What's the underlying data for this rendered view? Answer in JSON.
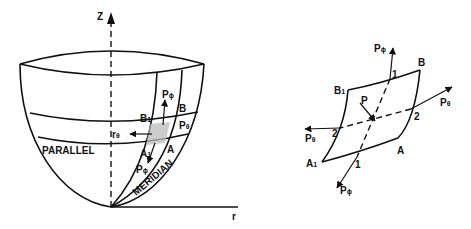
{
  "left_figure": {
    "axis_z": "Z",
    "axis_r": "r",
    "parallel": "PARALLEL",
    "meridian": "MERIDIAN",
    "point_B1": "B",
    "point_B1_sub": "1",
    "point_B": "B",
    "point_A1": "A",
    "point_A1_sub": "1",
    "point_A": "A",
    "force_p_phi_top": "P",
    "force_p_phi_top_sub": "ϕ",
    "force_p_phi_bottom": "P",
    "force_p_phi_bottom_sub": "ϕ",
    "force_p_theta": "P",
    "force_p_theta_sub": "θ",
    "force_r_theta": "r",
    "force_r_theta_sub": "θ"
  },
  "right_figure": {
    "point_B": "B",
    "point_B1": "B",
    "point_B1_sub": "1",
    "point_A": "A",
    "point_A1": "A",
    "point_A1_sub": "1",
    "point_P": "P",
    "mark_1_top": "1",
    "mark_1_bottom": "1",
    "mark_2_right": "2",
    "mark_2_left": "2",
    "p_phi_top": "P",
    "p_phi_top_sub": "ϕ",
    "p_phi_bottom": "P",
    "p_phi_bottom_sub": "ϕ",
    "p_theta_right": "P",
    "p_theta_right_sub": "θ",
    "p_theta_left": "P",
    "p_theta_left_sub": "θ"
  }
}
